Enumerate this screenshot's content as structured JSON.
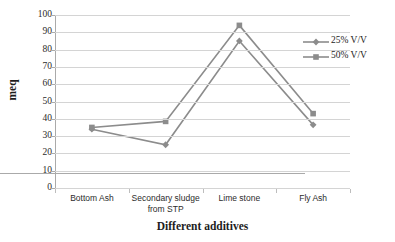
{
  "chart_data": {
    "type": "line",
    "title": "",
    "xlabel": "Different additives",
    "ylabel": "meq",
    "categories": [
      "Bottom Ash",
      "Secondary sludge from STP",
      "Lime stone",
      "Fly Ash"
    ],
    "category_lines": [
      [
        "Bottom Ash"
      ],
      [
        "Secondary sludge",
        "from STP"
      ],
      [
        "Lime stone"
      ],
      [
        "Fly Ash"
      ]
    ],
    "series": [
      {
        "name": "25% V/V",
        "marker": "diamond",
        "color": "#8c8c8c",
        "values": [
          34,
          25,
          85,
          36.5
        ]
      },
      {
        "name": "50% V/V",
        "marker": "square",
        "color": "#8c8c8c",
        "values": [
          35,
          38.5,
          94,
          43
        ]
      }
    ],
    "ylim": [
      0,
      100
    ],
    "ytick_step": 10,
    "yticks": [
      0,
      10,
      20,
      30,
      40,
      50,
      60,
      70,
      80,
      90,
      100
    ],
    "ytick_labels": [
      "0",
      "10",
      "20",
      "30",
      "40",
      "50",
      "60",
      "70",
      "80",
      "90",
      "100"
    ],
    "grid": true,
    "grid_axis": "y",
    "legend_position": "right",
    "colors": {
      "series_line": "#8c8c8c",
      "gridline": "#d4d4d4",
      "axis": "#aaaaaa",
      "text": "#2b2b2b",
      "title_text": "#1d1d1d",
      "background": "#ffffff"
    }
  }
}
